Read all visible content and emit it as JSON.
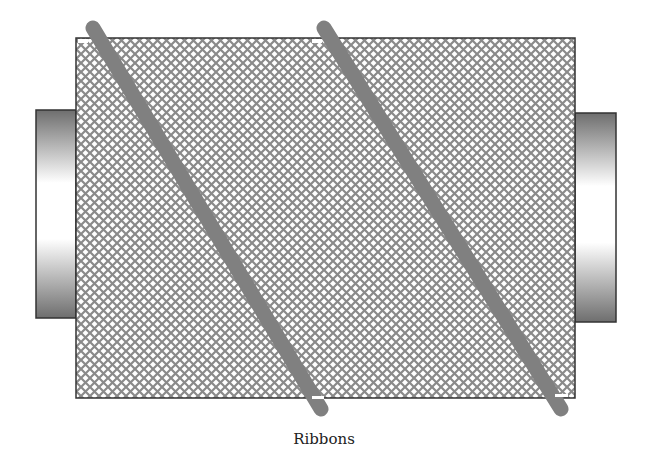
{
  "figure": {
    "caption": "Ribbons",
    "colors": {
      "background": "#ffffff",
      "mesh_line": "#8a8a8a",
      "mesh_border": "#333333",
      "ribbon": "#808080",
      "cap_dark": "#6e6e6e",
      "cap_light": "#ffffff",
      "cap_border": "#333333"
    },
    "components": [
      {
        "name": "cylinder-mesh-body",
        "shape": "rectangle",
        "pattern": "crosshatch"
      },
      {
        "name": "left-end-cap",
        "shape": "rectangle",
        "fill": "vertical-gradient"
      },
      {
        "name": "right-end-cap",
        "shape": "rectangle",
        "fill": "vertical-gradient"
      },
      {
        "name": "ribbon-1",
        "shape": "diagonal-band"
      },
      {
        "name": "ribbon-2",
        "shape": "diagonal-band"
      }
    ]
  }
}
